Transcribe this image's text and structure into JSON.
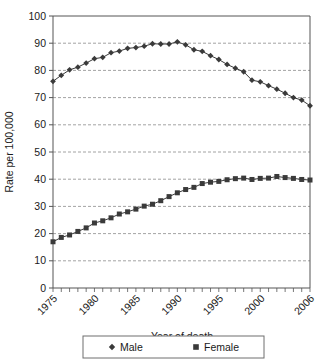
{
  "chart_data": {
    "type": "line",
    "title": "",
    "xlabel": "Year of death",
    "ylabel": "Rate per 100,000",
    "xlim": [
      1975,
      2006
    ],
    "ylim": [
      0,
      100
    ],
    "ytick_step": 10,
    "grid": true,
    "grid_axis": "y",
    "legend_position": "bottom",
    "x": [
      1975,
      1976,
      1977,
      1978,
      1979,
      1980,
      1981,
      1982,
      1983,
      1984,
      1985,
      1986,
      1987,
      1988,
      1989,
      1990,
      1991,
      1992,
      1993,
      1994,
      1995,
      1996,
      1997,
      1998,
      1999,
      2000,
      2001,
      2002,
      2003,
      2004,
      2005,
      2006
    ],
    "xtick_labels": [
      "1975",
      "1980",
      "1985",
      "1990",
      "1995",
      "2000",
      "2006"
    ],
    "xtick_values": [
      1975,
      1980,
      1985,
      1990,
      1995,
      2000,
      2006
    ],
    "ytick_labels": [
      "0",
      "10",
      "20",
      "30",
      "40",
      "50",
      "60",
      "70",
      "80",
      "90",
      "100"
    ],
    "series": [
      {
        "name": "Male",
        "marker": "diamond",
        "color": "#3a3a3a",
        "values": [
          76.0,
          78.2,
          80.2,
          81.2,
          82.7,
          84.3,
          84.8,
          86.5,
          87.1,
          88.1,
          88.4,
          88.9,
          89.8,
          89.7,
          89.7,
          90.5,
          89.4,
          87.6,
          87.0,
          85.4,
          84.0,
          82.2,
          80.8,
          79.5,
          76.4,
          75.8,
          74.4,
          73.1,
          71.6,
          70.0,
          69.1,
          67.0
        ]
      },
      {
        "name": "Female",
        "marker": "square",
        "color": "#3a3a3a",
        "values": [
          17.0,
          18.6,
          19.5,
          20.8,
          22.1,
          23.9,
          24.7,
          25.8,
          27.2,
          28.0,
          29.0,
          30.1,
          30.8,
          32.1,
          33.6,
          35.0,
          36.2,
          37.0,
          38.4,
          38.9,
          39.2,
          39.8,
          40.2,
          40.4,
          39.9,
          40.3,
          40.4,
          41.0,
          40.6,
          40.3,
          39.9,
          39.7
        ]
      }
    ]
  },
  "legend": {
    "entries": [
      {
        "label": "Male",
        "marker": "diamond"
      },
      {
        "label": "Female",
        "marker": "square"
      }
    ]
  }
}
